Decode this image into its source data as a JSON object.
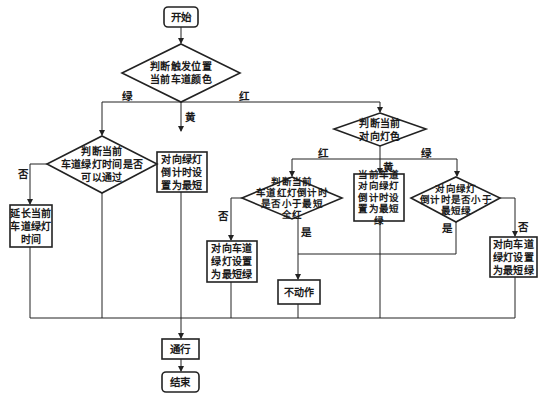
{
  "nodes": {
    "start": "开始",
    "decision_current_color": "判断触发位置\n当前车道颜色",
    "decision_green_time": "判断当前\n车道绿灯时间是否\n可以通过",
    "extend_green": "延长当前\n车道绿灯\n时间",
    "yellow_action": "对向绿灯\n倒计时设\n置为最短",
    "decision_opposite_color": "判断当前\n对向灯色",
    "decision_red_countdown": "判断当前\n车道红灯倒计时\n是否小于最短\n全红",
    "set_opposite_green_min": "对向车道\n绿灯设置\n为最短绿",
    "no_action": "不动作",
    "yellow_opposite_action": "当前车道\n对向绿灯\n倒计时设\n置为最短绿",
    "decision_opposite_green_countdown": "对向绿灯\n倒计时是否小于\n最短绿",
    "set_opposite_green_min_2": "对向车道\n绿灯设置\n为最短绿",
    "pass": "通行",
    "end": "结束"
  },
  "labels": {
    "green_1": "绿",
    "red_1": "红",
    "yellow_1": "黄",
    "no_1": "否",
    "red_2": "红",
    "yellow_2": "黄",
    "green_2": "绿",
    "no_2": "否",
    "yes_1": "是",
    "yes_2": "是",
    "no_3": "否"
  },
  "colors": {
    "stroke": "#222222",
    "background": "#ffffff"
  }
}
